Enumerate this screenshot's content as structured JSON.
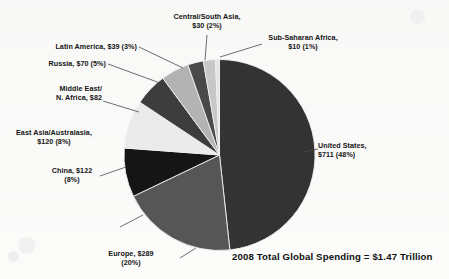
{
  "chart_data": {
    "type": "pie",
    "title": "",
    "caption": "2008 Total Global Spending = $1.47 Trillion",
    "units": "billions of US dollars",
    "total_label": "$1.47 Trillion",
    "legend_position": "callout-labels",
    "start_angle_deg": 0,
    "direction": "clockwise",
    "categories": [
      "United States",
      "Europe",
      "China",
      "East Asia/Australasia",
      "Middle East/N. Africa",
      "Russia",
      "Latin America",
      "Central/South Asia",
      "Sub-Saharan Africa"
    ],
    "values": [
      711,
      289,
      122,
      120,
      82,
      70,
      39,
      30,
      10
    ],
    "percents": [
      48,
      20,
      8,
      8,
      6,
      5,
      3,
      2,
      1
    ],
    "colors": [
      "#333333",
      "#565656",
      "#151515",
      "#ececed",
      "#3d3d3d",
      "#b4b4b4",
      "#4a4a4a",
      "#c9c9c9",
      "#e6e6e6"
    ]
  },
  "labels": [
    {
      "name": "united-states",
      "line1": "United States,",
      "line2": "$711 (48%)"
    },
    {
      "name": "europe",
      "line1": "Europe, $289",
      "line2": "(20%)"
    },
    {
      "name": "china",
      "line1": "China, $122",
      "line2": "(8%)"
    },
    {
      "name": "east-asia-australasia",
      "line1": "East Asia/Australasia,",
      "line2": "$120 (8%)"
    },
    {
      "name": "middle-east-n-africa",
      "line1": "Middle East/",
      "line2": "N. Africa, $82"
    },
    {
      "name": "russia",
      "line1": "Russia, $70 (5%)",
      "line2": ""
    },
    {
      "name": "latin-america",
      "line1": "Latin America, $39 (3%)",
      "line2": ""
    },
    {
      "name": "central-south-asia",
      "line1": "Central/South Asia,",
      "line2": "$30 (2%)"
    },
    {
      "name": "sub-saharan-africa",
      "line1": "Sub-Saharan Africa,",
      "line2": "$10 (1%)"
    }
  ],
  "caption": {
    "total_text": "2008 Total Global Spending = $1.47 Trillion"
  }
}
